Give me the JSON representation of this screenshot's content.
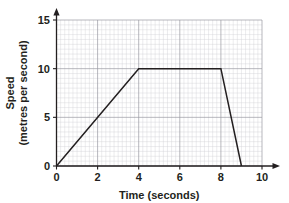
{
  "chart_data": {
    "type": "line",
    "title": "",
    "subtitle": "",
    "xlabel": "Time (seconds)",
    "ylabel_line1": "Speed",
    "ylabel_line2": "(metres per second)",
    "ylabel": "Speed (metres per second)",
    "xlim": [
      0,
      10
    ],
    "ylim": [
      0,
      15
    ],
    "x_ticks": [
      0,
      2,
      4,
      6,
      8,
      10
    ],
    "x_tick_labels": [
      "0",
      "2",
      "4",
      "6",
      "8",
      "10"
    ],
    "y_ticks": [
      0,
      5,
      10,
      15
    ],
    "y_tick_labels": [
      "0",
      "5",
      "10",
      "15"
    ],
    "x_major_step": 2,
    "x_minor_step": 0.2,
    "y_major_step": 5,
    "y_minor_step": 0.5,
    "grid": true,
    "grid_minor": true,
    "legend": "none",
    "series": [
      {
        "name": "Speed",
        "x": [
          0,
          4,
          8,
          9
        ],
        "y": [
          0,
          10,
          10,
          0
        ],
        "points": [
          {
            "x": 0,
            "y": 0
          },
          {
            "x": 4,
            "y": 10
          },
          {
            "x": 8,
            "y": 10
          },
          {
            "x": 9,
            "y": 0
          }
        ]
      }
    ],
    "annotations": [],
    "colors": {
      "line": "#231f20",
      "axis": "#231f20",
      "grid_major": "#9a9aa2",
      "grid_minor": "#cfcfd4",
      "background": "#ffffff",
      "text": "#231f20"
    }
  }
}
